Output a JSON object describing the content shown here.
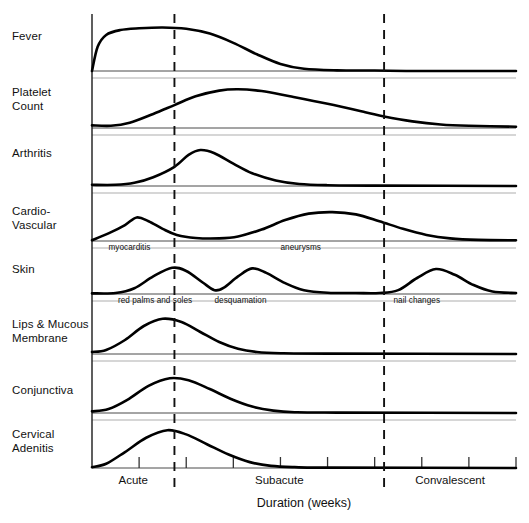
{
  "chart_data": {
    "type": "line",
    "title": "",
    "xlabel": "Duration (weeks)",
    "ylabel": "",
    "grid": false,
    "legend_position": "none",
    "xlim": [
      0,
      9
    ],
    "x_tick_weeks": [
      0,
      1,
      2,
      3,
      4,
      5,
      6,
      7,
      8,
      9
    ],
    "phase_separator_weeks": [
      1.75,
      6.2
    ],
    "phases": [
      {
        "name": "Acute",
        "label": "Acute",
        "start_week": 0,
        "end_week": 1.75
      },
      {
        "name": "Subacute",
        "label": "Subacute",
        "start_week": 1.75,
        "end_week": 6.2
      },
      {
        "name": "Convalescent",
        "label": "Convalescent",
        "start_week": 6.2,
        "end_week": 9
      }
    ],
    "series": [
      {
        "name": "Fever",
        "label": "Fever",
        "annotations": [],
        "points": [
          [
            0.0,
            0.0
          ],
          [
            0.12,
            0.55
          ],
          [
            0.3,
            0.82
          ],
          [
            0.6,
            0.93
          ],
          [
            1.0,
            0.97
          ],
          [
            1.5,
            0.99
          ],
          [
            2.0,
            0.96
          ],
          [
            2.5,
            0.85
          ],
          [
            3.0,
            0.64
          ],
          [
            3.5,
            0.38
          ],
          [
            4.0,
            0.16
          ],
          [
            4.5,
            0.05
          ],
          [
            5.2,
            0.015
          ],
          [
            6.0,
            0.01
          ],
          [
            7.0,
            0.0
          ],
          [
            9.0,
            0.0
          ]
        ]
      },
      {
        "name": "Platelet Count",
        "label": "Platelet\nCount",
        "annotations": [],
        "points": [
          [
            0.0,
            0.06
          ],
          [
            0.4,
            0.05
          ],
          [
            0.8,
            0.12
          ],
          [
            1.3,
            0.32
          ],
          [
            1.75,
            0.52
          ],
          [
            2.2,
            0.72
          ],
          [
            2.7,
            0.85
          ],
          [
            3.1,
            0.88
          ],
          [
            3.6,
            0.84
          ],
          [
            4.2,
            0.72
          ],
          [
            5.0,
            0.55
          ],
          [
            5.8,
            0.36
          ],
          [
            6.2,
            0.26
          ],
          [
            6.8,
            0.15
          ],
          [
            7.4,
            0.08
          ],
          [
            8.0,
            0.05
          ],
          [
            9.0,
            0.03
          ]
        ]
      },
      {
        "name": "Arthritis",
        "label": "Arthritis",
        "annotations": [],
        "points": [
          [
            0.0,
            0.03
          ],
          [
            0.5,
            0.03
          ],
          [
            0.9,
            0.08
          ],
          [
            1.3,
            0.22
          ],
          [
            1.75,
            0.48
          ],
          [
            2.05,
            0.78
          ],
          [
            2.3,
            0.9
          ],
          [
            2.6,
            0.82
          ],
          [
            3.0,
            0.56
          ],
          [
            3.4,
            0.32
          ],
          [
            3.9,
            0.14
          ],
          [
            4.4,
            0.05
          ],
          [
            5.0,
            0.02
          ],
          [
            6.0,
            0.01
          ],
          [
            9.0,
            0.0
          ]
        ]
      },
      {
        "name": "Cardio-Vascular",
        "label": "Cardio-\nVascular",
        "annotations": [
          {
            "text": "myocarditis",
            "week": 0.35
          },
          {
            "text": "aneurysms",
            "week": 4.0
          }
        ],
        "points": [
          [
            0.0,
            0.02
          ],
          [
            0.35,
            0.2
          ],
          [
            0.7,
            0.42
          ],
          [
            0.95,
            0.62
          ],
          [
            1.2,
            0.52
          ],
          [
            1.5,
            0.32
          ],
          [
            1.8,
            0.16
          ],
          [
            2.2,
            0.08
          ],
          [
            2.7,
            0.07
          ],
          [
            3.1,
            0.12
          ],
          [
            3.6,
            0.3
          ],
          [
            4.1,
            0.55
          ],
          [
            4.6,
            0.72
          ],
          [
            5.1,
            0.76
          ],
          [
            5.6,
            0.7
          ],
          [
            6.1,
            0.52
          ],
          [
            6.6,
            0.32
          ],
          [
            7.1,
            0.16
          ],
          [
            7.6,
            0.07
          ],
          [
            8.2,
            0.03
          ],
          [
            9.0,
            0.02
          ]
        ]
      },
      {
        "name": "Skin",
        "label": "Skin",
        "annotations": [
          {
            "text": "red palms and soles",
            "week": 0.55
          },
          {
            "text": "desquamation",
            "week": 2.6
          },
          {
            "text": "nail changes",
            "week": 6.4
          }
        ],
        "points": [
          [
            0.0,
            0.02
          ],
          [
            0.5,
            0.03
          ],
          [
            0.9,
            0.18
          ],
          [
            1.3,
            0.55
          ],
          [
            1.7,
            0.82
          ],
          [
            2.0,
            0.72
          ],
          [
            2.35,
            0.36
          ],
          [
            2.6,
            0.12
          ],
          [
            2.8,
            0.2
          ],
          [
            3.1,
            0.55
          ],
          [
            3.4,
            0.8
          ],
          [
            3.7,
            0.66
          ],
          [
            4.1,
            0.34
          ],
          [
            4.5,
            0.12
          ],
          [
            5.0,
            0.04
          ],
          [
            5.6,
            0.03
          ],
          [
            6.1,
            0.03
          ],
          [
            6.5,
            0.12
          ],
          [
            6.9,
            0.5
          ],
          [
            7.3,
            0.78
          ],
          [
            7.7,
            0.6
          ],
          [
            8.1,
            0.28
          ],
          [
            8.5,
            0.08
          ],
          [
            9.0,
            0.03
          ]
        ]
      },
      {
        "name": "Lips & Mucous Membrane",
        "label": "Lips & Mucous\nMembrane",
        "annotations": [],
        "points": [
          [
            0.0,
            0.05
          ],
          [
            0.3,
            0.1
          ],
          [
            0.7,
            0.35
          ],
          [
            1.1,
            0.7
          ],
          [
            1.5,
            0.88
          ],
          [
            1.9,
            0.8
          ],
          [
            2.3,
            0.55
          ],
          [
            2.7,
            0.3
          ],
          [
            3.1,
            0.13
          ],
          [
            3.5,
            0.05
          ],
          [
            4.0,
            0.02
          ],
          [
            5.0,
            0.01
          ],
          [
            9.0,
            0.0
          ]
        ]
      },
      {
        "name": "Conjunctiva",
        "label": "Conjunctiva",
        "annotations": [],
        "points": [
          [
            0.0,
            0.04
          ],
          [
            0.35,
            0.1
          ],
          [
            0.75,
            0.33
          ],
          [
            1.2,
            0.68
          ],
          [
            1.65,
            0.87
          ],
          [
            2.05,
            0.82
          ],
          [
            2.5,
            0.6
          ],
          [
            2.95,
            0.35
          ],
          [
            3.4,
            0.16
          ],
          [
            3.85,
            0.06
          ],
          [
            4.3,
            0.02
          ],
          [
            5.2,
            0.01
          ],
          [
            9.0,
            0.0
          ]
        ]
      },
      {
        "name": "Cervical Adenitis",
        "label": "Cervical\nAdenitis",
        "annotations": [],
        "points": [
          [
            0.0,
            0.02
          ],
          [
            0.3,
            0.1
          ],
          [
            0.7,
            0.38
          ],
          [
            1.15,
            0.72
          ],
          [
            1.6,
            0.9
          ],
          [
            2.0,
            0.8
          ],
          [
            2.45,
            0.56
          ],
          [
            2.9,
            0.32
          ],
          [
            3.35,
            0.14
          ],
          [
            3.8,
            0.05
          ],
          [
            4.3,
            0.02
          ],
          [
            5.0,
            0.01
          ],
          [
            9.0,
            0.0
          ]
        ]
      }
    ]
  },
  "axis": {
    "title": "Duration (weeks)",
    "phase_labels": [
      "Acute",
      "Subacute",
      "Convalescent"
    ]
  }
}
